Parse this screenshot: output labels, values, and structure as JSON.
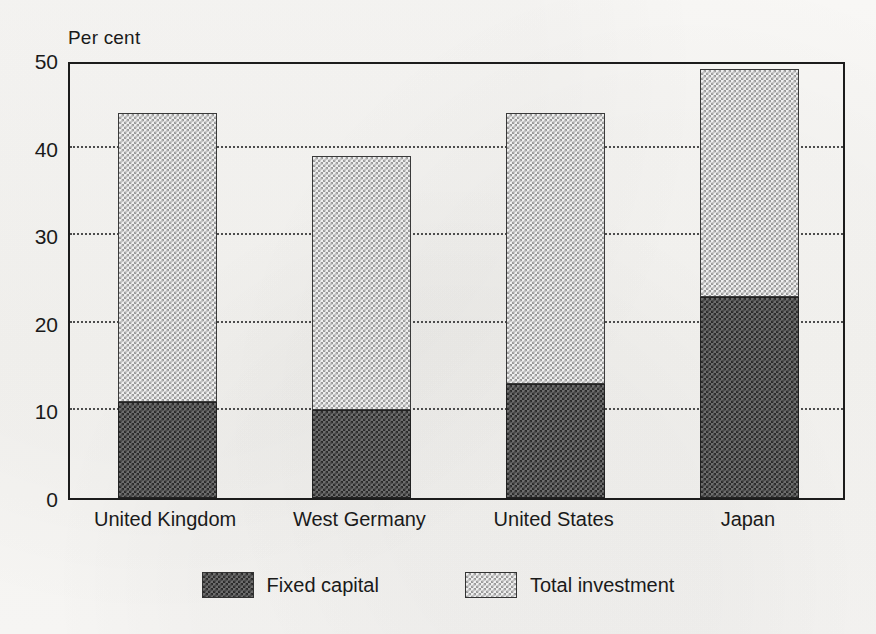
{
  "chart_data": {
    "type": "bar",
    "subtype": "stacked",
    "title": "",
    "xlabel": "",
    "ylabel": "Per cent",
    "ylim": [
      0,
      50
    ],
    "yticks": [
      0,
      10,
      20,
      30,
      40,
      50
    ],
    "ytick_labels": [
      "0",
      "10",
      "20",
      "30",
      "40",
      "50"
    ],
    "grid": "horizontal-dotted",
    "legend_position": "bottom-center",
    "categories": [
      "United Kingdom",
      "West Germany",
      "United States",
      "Japan"
    ],
    "series": [
      {
        "name": "Fixed capital",
        "fill": "dark-checkerboard",
        "color": "#3a3a3a",
        "values": [
          11,
          10,
          13,
          23
        ]
      },
      {
        "name": "Total investment",
        "fill": "light-checkerboard",
        "color": "#d8d8d8",
        "values": [
          44,
          39,
          44,
          49
        ],
        "note": "Total investment is the full bar height; light segment is the remainder above fixed capital."
      }
    ],
    "stack_remainder": [
      33,
      29,
      31,
      26
    ],
    "annotations": []
  },
  "axis": {
    "unit_label": "Per cent"
  },
  "legend": {
    "items": [
      {
        "label": "Fixed capital",
        "swatch": "dark-checkerboard-swatch"
      },
      {
        "label": "Total investment",
        "swatch": "light-checkerboard-swatch"
      }
    ]
  },
  "colors": {
    "background": "#f6f5f2",
    "frame": "#1c1c1c",
    "gridline": "#4d4d4d",
    "fixed_capital_fill": "#3a3a3a",
    "total_investment_fill": "#d8d8d8"
  }
}
